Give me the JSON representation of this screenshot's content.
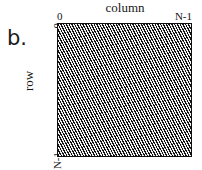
{
  "figure": {
    "panel_label": "b.",
    "background_color": "#ffffff",
    "ink_color": "#111111"
  },
  "axes": {
    "column": {
      "title": "column",
      "start_tick": "0",
      "end_tick": "N-1",
      "position": "top",
      "direction": "left-to-right"
    },
    "row": {
      "title": "row",
      "start_tick": "0",
      "end_tick": "N-1",
      "position": "left",
      "direction": "top-to-bottom",
      "rotation_degrees": -90
    }
  },
  "matrix": {
    "name": "hatched-matrix-region",
    "fill_style": "diagonal-hatch",
    "hatch_direction": "forward-slash",
    "hatch_angle_degrees": 62,
    "hatch_spacing_px": 2.4,
    "hatch_line_color": "#111111",
    "hatch_gap_color": "#f2f2f2",
    "border_color": "#101010",
    "border_width_px": 1.5,
    "shape": "square",
    "coverage": "full"
  },
  "chart_data": {
    "type": "heatmap",
    "title": "",
    "subtitle": "",
    "xlabel": "column",
    "ylabel": "row",
    "xticklabels": [
      "0",
      "N-1"
    ],
    "yticklabels": [
      "0",
      "N-1"
    ],
    "xlim": [
      0,
      "N-1"
    ],
    "ylim": [
      "N-1",
      0
    ],
    "grid": false,
    "legend": "none",
    "annotations": [
      "b."
    ],
    "cells": "all"
  }
}
